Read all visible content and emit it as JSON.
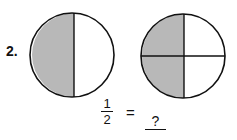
{
  "problem": {
    "number": "2.",
    "figures": [
      {
        "name": "halves-circle",
        "parts": 2,
        "shaded": 1,
        "shade_color": "#b8b8b8"
      },
      {
        "name": "quarters-circle",
        "parts": 4,
        "shaded": 2,
        "shade_color": "#b8b8b8"
      }
    ],
    "equation": {
      "numerator": "1",
      "denominator": "2",
      "equals": "=",
      "answer_blank": "?"
    }
  }
}
